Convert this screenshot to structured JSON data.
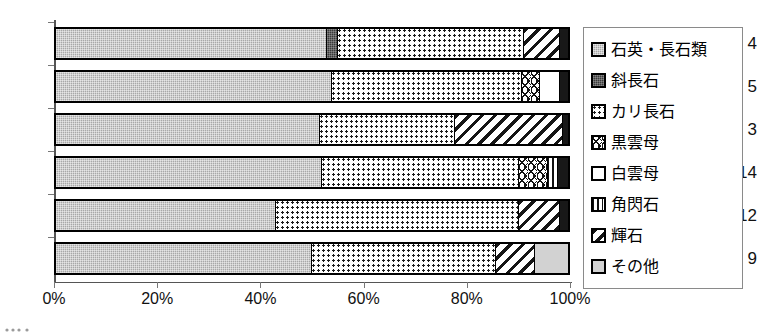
{
  "chart_data": {
    "type": "bar",
    "orientation": "horizontal",
    "stacked": true,
    "normalized_percent": true,
    "title": "",
    "xlabel": "",
    "ylabel": "",
    "xlim": [
      0,
      100
    ],
    "xticks": [
      0,
      20,
      40,
      60,
      80,
      100
    ],
    "xtick_labels": [
      "0%",
      "20%",
      "40%",
      "60%",
      "80%",
      "100%"
    ],
    "grid": false,
    "legend_position": "right",
    "categories": [
      "4",
      "5",
      "3",
      "14",
      "12",
      "9"
    ],
    "series": [
      {
        "name": "石英・長石類",
        "pattern": "solid-gray",
        "values": [
          53.0,
          54.0,
          51.5,
          52.0,
          43.0,
          50.0
        ]
      },
      {
        "name": "斜長石",
        "pattern": "solid-dark",
        "values": [
          2.0,
          0.0,
          0.0,
          0.0,
          0.0,
          0.0
        ]
      },
      {
        "name": "カリ長石",
        "pattern": "fine-dots",
        "values": [
          36.5,
          37.0,
          26.5,
          38.5,
          47.5,
          36.0
        ]
      },
      {
        "name": "黒雲母",
        "pattern": "chevron",
        "values": [
          0.0,
          3.5,
          0.0,
          5.5,
          0.0,
          0.0
        ]
      },
      {
        "name": "白雲母",
        "pattern": "white",
        "values": [
          0.0,
          4.0,
          0.0,
          0.0,
          0.0,
          0.0
        ]
      },
      {
        "name": "角閃石",
        "pattern": "vertical-lines",
        "values": [
          0.0,
          0.0,
          0.0,
          2.0,
          0.0,
          0.0
        ]
      },
      {
        "name": "輝石",
        "pattern": "diagonal-hatch",
        "values": [
          7.0,
          0.0,
          21.0,
          0.0,
          8.0,
          7.5
        ]
      },
      {
        "name": "その他",
        "pattern": "light-gray",
        "values": [
          1.5,
          1.5,
          1.0,
          2.0,
          1.5,
          6.5
        ]
      }
    ]
  },
  "axis": {
    "y_categories": [
      "4",
      "5",
      "3",
      "14",
      "12",
      "9"
    ],
    "x_tick_labels": [
      "0%",
      "20%",
      "40%",
      "60%",
      "80%",
      "100%"
    ]
  },
  "legend": {
    "items": [
      {
        "label": "石英・長石類",
        "swatch": "quartz-feldspar-swatch"
      },
      {
        "label": "斜長石",
        "swatch": "plagioclase-swatch"
      },
      {
        "label": "カリ長石",
        "swatch": "k-feldspar-swatch"
      },
      {
        "label": "黒雲母",
        "swatch": "biotite-swatch"
      },
      {
        "label": "白雲母",
        "swatch": "muscovite-swatch"
      },
      {
        "label": "角閃石",
        "swatch": "hornblende-swatch"
      },
      {
        "label": "輝石",
        "swatch": "pyroxene-swatch"
      },
      {
        "label": "その他",
        "swatch": "other-swatch"
      }
    ]
  },
  "bars": [
    {
      "category": "4",
      "segments": [
        {
          "series": "石英・長石類",
          "pattern": "p-quartz",
          "pct": 53.0
        },
        {
          "series": "斜長石",
          "pattern": "p-plag",
          "pct": 2.0
        },
        {
          "series": "カリ長石",
          "pattern": "p-kfeld",
          "pct": 36.5
        },
        {
          "series": "輝石",
          "pattern": "p-pyrox",
          "pct": 7.0
        },
        {
          "series": "その他",
          "pattern": "p-dark",
          "pct": 1.5
        }
      ]
    },
    {
      "category": "5",
      "segments": [
        {
          "series": "石英・長石類",
          "pattern": "p-quartz",
          "pct": 54.0
        },
        {
          "series": "カリ長石",
          "pattern": "p-kfeld",
          "pct": 37.0
        },
        {
          "series": "黒雲母",
          "pattern": "p-biotite",
          "pct": 3.5
        },
        {
          "series": "白雲母",
          "pattern": "p-musc",
          "pct": 4.0
        },
        {
          "series": "その他",
          "pattern": "p-dark",
          "pct": 1.5
        }
      ]
    },
    {
      "category": "3",
      "segments": [
        {
          "series": "石英・長石類",
          "pattern": "p-quartz",
          "pct": 51.5
        },
        {
          "series": "カリ長石",
          "pattern": "p-kfeld",
          "pct": 26.5
        },
        {
          "series": "輝石",
          "pattern": "p-pyrox",
          "pct": 21.0
        },
        {
          "series": "その他",
          "pattern": "p-dark",
          "pct": 1.0
        }
      ]
    },
    {
      "category": "14",
      "segments": [
        {
          "series": "石英・長石類",
          "pattern": "p-quartz",
          "pct": 52.0
        },
        {
          "series": "カリ長石",
          "pattern": "p-kfeld",
          "pct": 38.5
        },
        {
          "series": "黒雲母",
          "pattern": "p-biotite",
          "pct": 5.5
        },
        {
          "series": "角閃石",
          "pattern": "p-horn",
          "pct": 2.0
        },
        {
          "series": "その他",
          "pattern": "p-dark",
          "pct": 2.0
        }
      ]
    },
    {
      "category": "12",
      "segments": [
        {
          "series": "石英・長石類",
          "pattern": "p-quartz",
          "pct": 43.0
        },
        {
          "series": "カリ長石",
          "pattern": "p-kfeld",
          "pct": 47.5
        },
        {
          "series": "輝石",
          "pattern": "p-pyrox",
          "pct": 8.0
        },
        {
          "series": "その他",
          "pattern": "p-dark",
          "pct": 1.5
        }
      ]
    },
    {
      "category": "9",
      "segments": [
        {
          "series": "石英・長石類",
          "pattern": "p-quartz",
          "pct": 50.0
        },
        {
          "series": "カリ長石",
          "pattern": "p-kfeld",
          "pct": 36.0
        },
        {
          "series": "輝石",
          "pattern": "p-pyrox",
          "pct": 7.5
        },
        {
          "series": "その他",
          "pattern": "p-other",
          "pct": 6.5
        }
      ]
    }
  ]
}
